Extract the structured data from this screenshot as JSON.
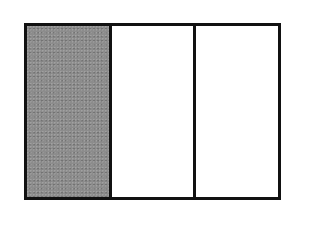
{
  "diagram": {
    "type": "fraction-bar",
    "total_parts": 3,
    "shaded_parts": 1,
    "shaded_color": "#8c8c8c",
    "border_color": "#111111",
    "background_color": "#ffffff",
    "segments": [
      {
        "index": 1,
        "shaded": true
      },
      {
        "index": 2,
        "shaded": false
      },
      {
        "index": 3,
        "shaded": false
      }
    ]
  }
}
